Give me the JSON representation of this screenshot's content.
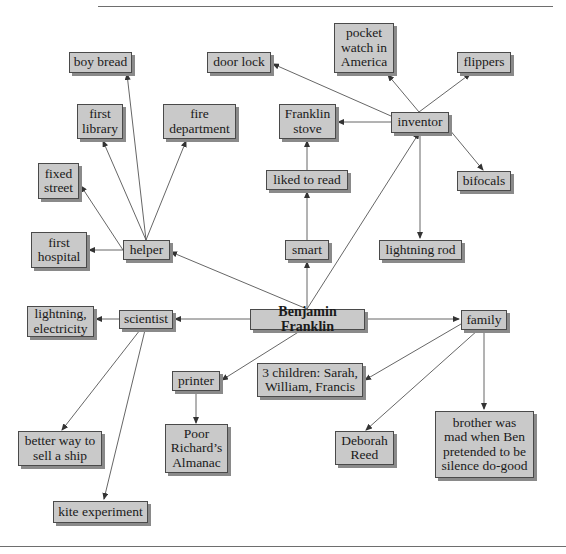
{
  "colors": {
    "node_fill": "#c9c9c9",
    "node_border": "#4a4a4a",
    "shadow": "#8a8a8a",
    "edge": "#555555"
  },
  "nodes": {
    "center": {
      "label": "Benjamin Franklin"
    },
    "helper": {
      "label": "helper"
    },
    "inventor": {
      "label": "inventor"
    },
    "smart": {
      "label": "smart"
    },
    "scientist": {
      "label": "scientist"
    },
    "printer": {
      "label": "printer"
    },
    "family": {
      "label": "family"
    },
    "boy_bread": {
      "label": "boy bread"
    },
    "first_library": {
      "label": "first\nlibrary"
    },
    "fire_department": {
      "label": "fire\ndepartment"
    },
    "fixed_street": {
      "label": "fixed\nstreet"
    },
    "first_hospital": {
      "label": "first\nhospital"
    },
    "door_lock": {
      "label": "door lock"
    },
    "pocket_watch": {
      "label": "pocket\nwatch in\nAmerica"
    },
    "flippers": {
      "label": "flippers"
    },
    "franklin_stove": {
      "label": "Franklin\nstove"
    },
    "bifocals": {
      "label": "bifocals"
    },
    "lightning_rod": {
      "label": "lightning rod"
    },
    "liked_to_read": {
      "label": "liked to read"
    },
    "lightning_electricity": {
      "label": "lightning,\nelectricity"
    },
    "better_way_ship": {
      "label": "better way to\nsell a ship"
    },
    "kite_experiment": {
      "label": "kite experiment"
    },
    "poor_richards": {
      "label": "Poor\nRichard’s\nAlmanac"
    },
    "three_children": {
      "label": "3 children: Sarah,\nWilliam, Francis"
    },
    "deborah_reed": {
      "label": "Deborah\nReed"
    },
    "brother": {
      "label": "brother was\nmad when Ben\npretended to be\nsilence do-good"
    }
  },
  "edges": [
    [
      "center",
      "helper"
    ],
    [
      "center",
      "inventor"
    ],
    [
      "center",
      "smart"
    ],
    [
      "center",
      "scientist"
    ],
    [
      "center",
      "printer"
    ],
    [
      "center",
      "family"
    ],
    [
      "helper",
      "boy_bread"
    ],
    [
      "helper",
      "first_library"
    ],
    [
      "helper",
      "fire_department"
    ],
    [
      "helper",
      "fixed_street"
    ],
    [
      "helper",
      "first_hospital"
    ],
    [
      "inventor",
      "door_lock"
    ],
    [
      "inventor",
      "pocket_watch"
    ],
    [
      "inventor",
      "flippers"
    ],
    [
      "inventor",
      "franklin_stove"
    ],
    [
      "inventor",
      "bifocals"
    ],
    [
      "inventor",
      "lightning_rod"
    ],
    [
      "smart",
      "liked_to_read"
    ],
    [
      "liked_to_read",
      "franklin_stove"
    ],
    [
      "scientist",
      "lightning_electricity"
    ],
    [
      "scientist",
      "better_way_ship"
    ],
    [
      "scientist",
      "kite_experiment"
    ],
    [
      "printer",
      "poor_richards"
    ],
    [
      "family",
      "three_children"
    ],
    [
      "family",
      "deborah_reed"
    ],
    [
      "family",
      "brother"
    ]
  ]
}
